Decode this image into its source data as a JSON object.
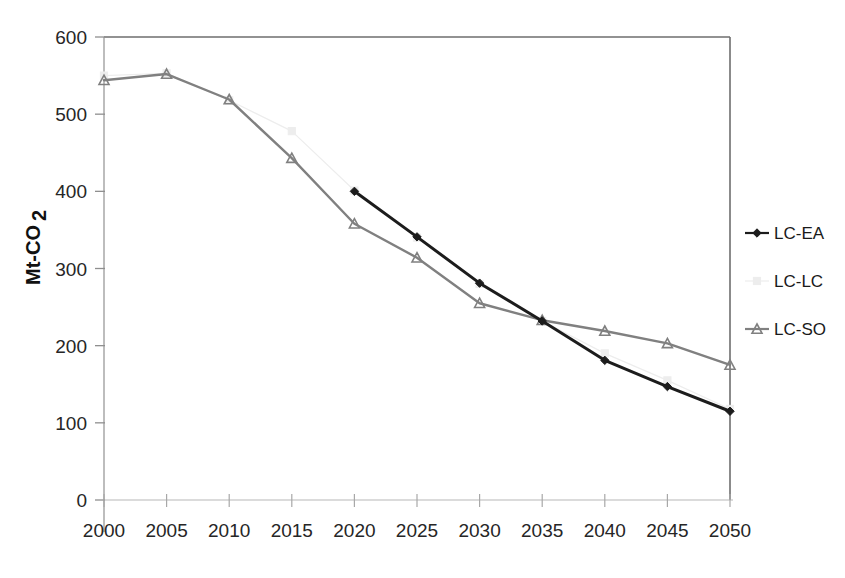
{
  "chart_data": {
    "type": "line",
    "title": "",
    "xlabel": "",
    "ylabel": "Mt-CO2",
    "ylabel_display": "Mt-CO",
    "ylabel_subscript": "2",
    "x": [
      2000,
      2005,
      2010,
      2015,
      2020,
      2025,
      2030,
      2035,
      2040,
      2045,
      2050
    ],
    "xtick_labels": [
      "2000",
      "2005",
      "2010",
      "2015",
      "2020",
      "2025",
      "2030",
      "2035",
      "2040",
      "2045",
      "2050"
    ],
    "ytick_labels": [
      "0",
      "100",
      "200",
      "300",
      "400",
      "500",
      "600"
    ],
    "yticks": [
      0,
      100,
      200,
      300,
      400,
      500,
      600
    ],
    "xlim": [
      2000,
      2050
    ],
    "ylim": [
      0,
      600
    ],
    "grid": false,
    "legend_position": "right",
    "series": [
      {
        "name": "LC-EA",
        "color": "#1c1c1c",
        "marker": "diamond",
        "x": [
          2020,
          2025,
          2030,
          2035,
          2040,
          2045,
          2050
        ],
        "values": [
          400,
          341,
          281,
          232,
          181,
          147,
          115
        ]
      },
      {
        "name": "LC-LC",
        "color": "#ededed",
        "marker": "square",
        "x": [
          2000,
          2005,
          2010,
          2015,
          2020,
          2025,
          2030,
          2035,
          2040,
          2045,
          2050
        ],
        "values": [
          550,
          553,
          518,
          478,
          401,
          340,
          280,
          232,
          190,
          155,
          118
        ]
      },
      {
        "name": "LC-SO",
        "color": "#808080",
        "marker": "triangle",
        "x": [
          2000,
          2005,
          2010,
          2015,
          2020,
          2025,
          2030,
          2035,
          2040,
          2045,
          2050
        ],
        "values": [
          544,
          552,
          519,
          443,
          358,
          314,
          255,
          233,
          219,
          203,
          175
        ]
      }
    ]
  },
  "legend": {
    "items": [
      {
        "label": "LC-EA"
      },
      {
        "label": "LC-LC"
      },
      {
        "label": "LC-SO"
      }
    ]
  },
  "axis": {
    "y_title": "Mt-CO",
    "y_title_sub": "2"
  }
}
